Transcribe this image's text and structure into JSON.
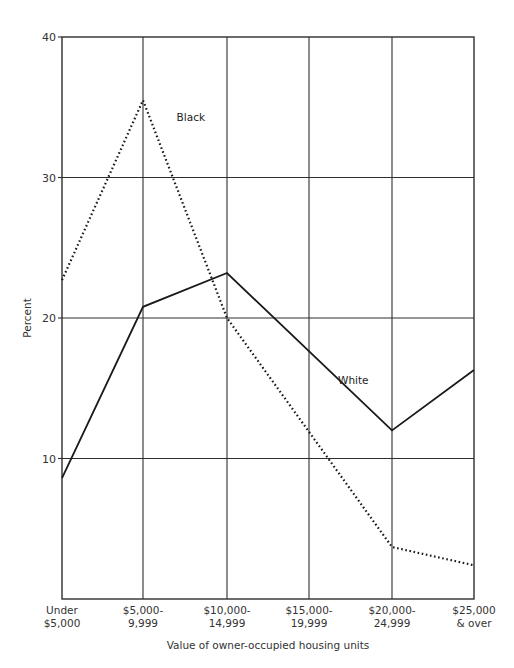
{
  "chart_data": {
    "type": "line",
    "title": "",
    "xlabel": "Value of owner-occupied housing units",
    "ylabel": "Percent",
    "ylim": [
      0,
      40
    ],
    "yticks": [
      10,
      20,
      30,
      40
    ],
    "grid": true,
    "legend": "inline labels",
    "categories": [
      [
        "Under",
        "$5,000"
      ],
      [
        "$5,000-",
        "9,999"
      ],
      [
        "$10,000-",
        "14,999"
      ],
      [
        "$15,000-",
        "19,999"
      ],
      [
        "$20,000-",
        "24,999"
      ],
      [
        "$25,000",
        "& over"
      ]
    ],
    "series": [
      {
        "name": "White",
        "style": "solid",
        "points": [
          [
            0,
            8.6
          ],
          [
            1,
            20.8
          ],
          [
            2,
            23.2
          ],
          [
            4,
            12.0
          ],
          [
            5,
            16.3
          ]
        ],
        "label_pos": [
          3.35,
          15.3
        ]
      },
      {
        "name": "Black",
        "style": "dotted",
        "points": [
          [
            0,
            22.7
          ],
          [
            1,
            35.5
          ],
          [
            2,
            20.0
          ],
          [
            4,
            3.7
          ],
          [
            5,
            2.4
          ]
        ],
        "label_pos": [
          1.4,
          34.0
        ]
      }
    ]
  },
  "colors": {
    "line": "#1a1a1a",
    "grid": "#2e2e2e",
    "text": "#333333"
  }
}
